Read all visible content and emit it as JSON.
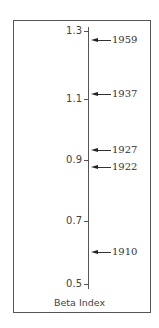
{
  "chart_data": {
    "type": "scatter",
    "title": "",
    "xlabel": "",
    "ylabel": "Beta Index",
    "ylim": [
      0.5,
      1.3
    ],
    "yticks": [
      1.3,
      1.1,
      0.9,
      0.7,
      0.5
    ],
    "ytick_labels": [
      "1.3",
      "1.1",
      "0.9",
      "0.7",
      "0.5"
    ],
    "grid": false,
    "legend": null,
    "orientation": "vertical single axis with labeled arrow markers",
    "points": [
      {
        "label": "1959",
        "value": 1.27
      },
      {
        "label": "1937",
        "value": 1.11
      },
      {
        "label": "1927",
        "value": 0.93
      },
      {
        "label": "1922",
        "value": 0.88
      },
      {
        "label": "1910",
        "value": 0.6
      }
    ]
  },
  "axis": {
    "title": "Beta Index",
    "ticks": [
      {
        "label": "1.3",
        "y": 31
      },
      {
        "label": "1.1",
        "y": 99
      },
      {
        "label": "0.9",
        "y": 160
      },
      {
        "label": "0.7",
        "y": 221
      },
      {
        "label": "0.5",
        "y": 284
      }
    ]
  },
  "markers": [
    {
      "label": "1959",
      "y": 40
    },
    {
      "label": "1937",
      "y": 94
    },
    {
      "label": "1927",
      "y": 150
    },
    {
      "label": "1922",
      "y": 167
    },
    {
      "label": "1910",
      "y": 252
    }
  ]
}
